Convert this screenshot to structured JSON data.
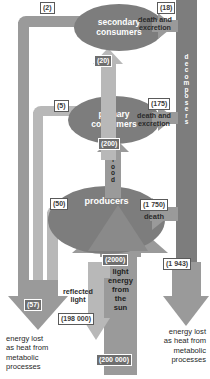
{
  "diagram": {
    "trophic_levels": [
      {
        "id": "secondary",
        "label": "secondary\nconsumers",
        "line1": "secondary",
        "line2": "consumers"
      },
      {
        "id": "primary",
        "label": "primary\nconsumers",
        "line1": "primary",
        "line2": "consumers"
      },
      {
        "id": "producers",
        "label": "producers",
        "line1": "producers",
        "line2": ""
      }
    ],
    "decomposers": {
      "label": "decomposers",
      "letters": "d e c o m p o s e r s"
    },
    "sun_column": {
      "value_top": "(2000)",
      "value_bottom": "(200 000)",
      "lines": [
        "light",
        "energy",
        "from",
        "the",
        "sun"
      ],
      "text": "light energy from the sun"
    },
    "food_arrow": {
      "value": "(200)",
      "label": "food",
      "letters": "f o o d"
    },
    "flows": [
      {
        "name": "secondary-respiration",
        "value": "(2)"
      },
      {
        "name": "secondary-death-excretion",
        "value": "(18)",
        "label": "death and excretion",
        "label_line1": "death and",
        "label_line2": "excretion"
      },
      {
        "name": "secondary-intake",
        "value": "(20)"
      },
      {
        "name": "primary-respiration",
        "value": "(5)"
      },
      {
        "name": "primary-death-excretion",
        "value": "(175)",
        "label": "death and excretion",
        "label_line1": "death and",
        "label_line2": "excretion"
      },
      {
        "name": "producers-respiration",
        "value": "(50)"
      },
      {
        "name": "producers-death",
        "value": "(1 750)",
        "label": "death"
      },
      {
        "name": "decomposers-heat-loss",
        "value": "(1 943)"
      },
      {
        "name": "metabolic-heat-loss-left",
        "value": "(57)"
      },
      {
        "name": "reflected-light",
        "value": "(198 000)",
        "label": "reflected light",
        "label_line1": "reflected",
        "label_line2": "light"
      }
    ],
    "captions": {
      "energy_lost_left": [
        "energy lost",
        "as heat from",
        "metabolic",
        "processes"
      ],
      "energy_lost_right": [
        "energy lost",
        "as heat from",
        "metabolic",
        "processes"
      ],
      "death_and_excretion_1": [
        "death and",
        "excretion"
      ],
      "death_and_excretion_2": [
        "death and",
        "excretion"
      ],
      "death": "death",
      "reflected_light": [
        "reflected",
        "light"
      ]
    },
    "colors": {
      "bar": "#9a9a9a",
      "bar_dark": "#7d7d7d",
      "bar_light": "#b8b8b8",
      "bar_pale": "#cfcfcf",
      "ellipse": "#7d7d7d",
      "chip_bg": "#ffffff",
      "chip_border": "#5a5a5a",
      "chip_text": "#3a3a3a",
      "text": "#1f1f1f",
      "background": "#ffffff"
    }
  }
}
